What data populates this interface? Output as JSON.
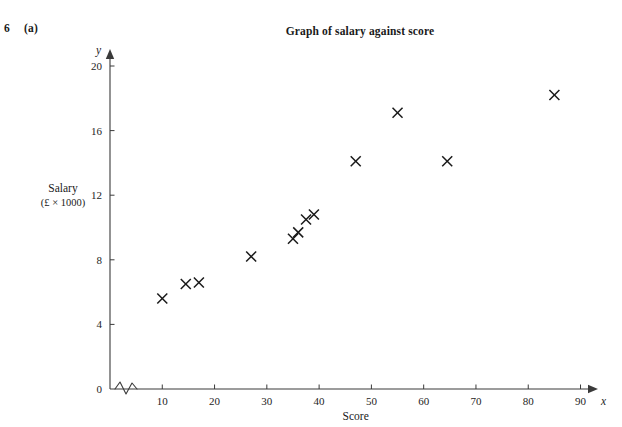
{
  "question": {
    "number": "6",
    "part": "(a)"
  },
  "chart_data": {
    "type": "scatter",
    "title": "Graph of salary against score",
    "xlabel": "Score",
    "ylabel": "Salary",
    "ylabel_unit": "(£ × 1000)",
    "x_axis_variable": "x",
    "y_axis_variable": "y",
    "xlim": [
      0,
      95
    ],
    "ylim": [
      0,
      21
    ],
    "x_ticks": [
      10,
      20,
      30,
      40,
      50,
      60,
      70,
      80,
      90
    ],
    "y_ticks": [
      0,
      4,
      8,
      12,
      16,
      20
    ],
    "x_tick_labels": [
      "10",
      "20",
      "30",
      "40",
      "50",
      "60",
      "70",
      "80",
      "90"
    ],
    "y_tick_labels": [
      "0",
      "4",
      "8",
      "12",
      "16",
      "20"
    ],
    "grid": false,
    "legend": null,
    "axis_break_x": true,
    "marker": "x",
    "marker_color": "#1a1a1a",
    "series": [
      {
        "name": "salary vs score",
        "points": [
          {
            "x": 10.0,
            "y": 5.6
          },
          {
            "x": 14.5,
            "y": 6.5
          },
          {
            "x": 17.0,
            "y": 6.6
          },
          {
            "x": 27.0,
            "y": 8.2
          },
          {
            "x": 35.0,
            "y": 9.3
          },
          {
            "x": 36.0,
            "y": 9.7
          },
          {
            "x": 37.5,
            "y": 10.5
          },
          {
            "x": 39.0,
            "y": 10.8
          },
          {
            "x": 47.0,
            "y": 14.1
          },
          {
            "x": 55.0,
            "y": 17.1
          },
          {
            "x": 64.5,
            "y": 14.1
          },
          {
            "x": 85.0,
            "y": 18.2
          }
        ]
      }
    ]
  },
  "geometry": {
    "origin_x_px": 110,
    "origin_y_px": 389,
    "x_unit_px": 5.228,
    "y_unit_px": 16.15,
    "axis_top_px": 50,
    "axis_right_px": 597
  }
}
